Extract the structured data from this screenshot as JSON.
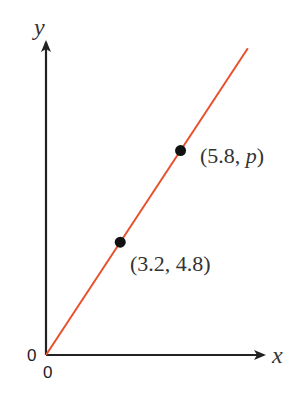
{
  "chart_data": {
    "type": "line",
    "title": "",
    "xlabel": "x",
    "ylabel": "y",
    "origin_labels": {
      "x": "0",
      "y": "0"
    },
    "line": {
      "description": "straight line through the origin",
      "color": "#e8502c",
      "points": [
        [
          0,
          0
        ],
        [
          3.2,
          4.8
        ],
        [
          5.8,
          8.7
        ]
      ]
    },
    "points": [
      {
        "x": 3.2,
        "y": 4.8,
        "label": "(3.2, 4.8)"
      },
      {
        "x": 5.8,
        "y": 8.7,
        "label_prefix": "(5.8, ",
        "label_var": "p",
        "label_suffix": ")"
      }
    ],
    "xlim": [
      0,
      8.5
    ],
    "ylim": [
      0,
      13
    ],
    "grid": false,
    "legend": "none",
    "colors": {
      "axis": "#222222",
      "line": "#e8502c",
      "point": "#111111"
    }
  }
}
